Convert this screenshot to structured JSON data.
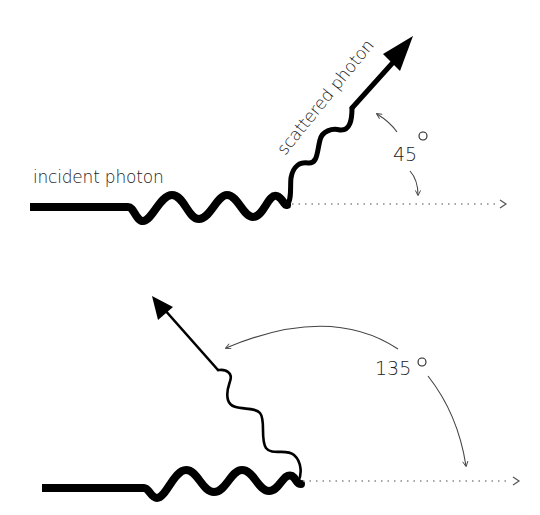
{
  "colors": {
    "background": "#ffffff",
    "stroke": "#000000",
    "arc": "#444444",
    "dotted": "#888888",
    "text": "#222222"
  },
  "top_panel": {
    "incident_label": "incident photon",
    "scattered_label": "scattered photon",
    "angle_label": "45",
    "angle_unit": "°",
    "angle_degrees": 45
  },
  "bottom_panel": {
    "angle_label": "135",
    "angle_unit": "°",
    "angle_degrees": 135
  }
}
